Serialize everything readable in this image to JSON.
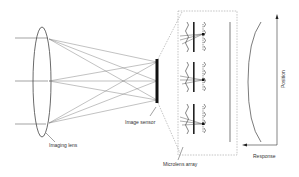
{
  "diagram": {
    "labels": {
      "imaging_lens": "Imaging lens",
      "image_sensor": "Image sensor",
      "microlens_array": "Microlens array",
      "response": "Response",
      "position": "Position"
    },
    "colors": {
      "line": "#555555",
      "dashed": "#888888",
      "sensor": "#111111",
      "background": "#ffffff"
    },
    "components": [
      "imaging-lens",
      "light-rays",
      "image-sensor",
      "microlens-array-inset",
      "response-curve",
      "position-axis"
    ]
  }
}
